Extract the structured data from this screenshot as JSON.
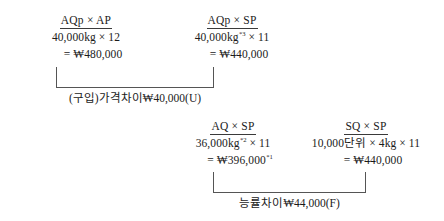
{
  "diagram": {
    "columns": [
      {
        "id": "aqp-ap",
        "header": "AQp × AP",
        "line1": "40,000kg × 12",
        "line1_sup": "",
        "line2": "= ₩480,000",
        "line2_sup": ""
      },
      {
        "id": "aqp-sp",
        "header": "AQp × SP",
        "line1_pre": "40,000kg",
        "line1_sup": "*3",
        "line1_post": " × 11",
        "line2": "= ₩440,000",
        "line2_sup": ""
      },
      {
        "id": "aq-sp",
        "header": "AQ × SP",
        "line1_pre": "36,000kg",
        "line1_sup": "*2",
        "line1_post": " × 11",
        "line2": "= ₩396,000",
        "line2_sup": "*1"
      },
      {
        "id": "sq-sp",
        "header": "SQ × SP",
        "line1": "10,000단위 × 4kg × 11",
        "line1_sup": "",
        "line2": "= ₩440,000",
        "line2_sup": ""
      }
    ],
    "variances": [
      {
        "id": "price-variance",
        "label": "(구입)가격차이₩40,000(U)"
      },
      {
        "id": "efficiency-variance",
        "label": "능률차이₩44,000(F)"
      }
    ]
  }
}
